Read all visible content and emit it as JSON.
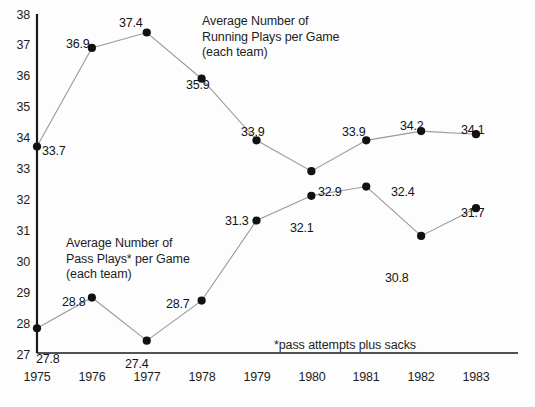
{
  "chart_data": {
    "type": "line",
    "title": "",
    "xlabel": "",
    "ylabel": "",
    "categories": [
      "1975",
      "1976",
      "1977",
      "1978",
      "1979",
      "1980",
      "1981",
      "1982",
      "1983"
    ],
    "x": [
      1975,
      1976,
      1977,
      1978,
      1979,
      1980,
      1981,
      1982,
      1983
    ],
    "ylim": [
      27,
      38
    ],
    "xlim": [
      1975,
      1983
    ],
    "grid": false,
    "legend_position": "inline-annotation",
    "yticks": [
      "27",
      "28",
      "29",
      "30",
      "31",
      "32",
      "33",
      "34",
      "35",
      "36",
      "37",
      "38"
    ],
    "series": [
      {
        "name": "Average Number of Running Plays per Game (each team)",
        "values": [
          33.7,
          36.9,
          37.4,
          35.9,
          33.9,
          32.9,
          33.9,
          34.2,
          34.1
        ],
        "labels": [
          "33.7",
          "36.9",
          "37.4",
          "35.9",
          "33.9",
          "32.9",
          "33.9",
          "34.2",
          "34.1"
        ]
      },
      {
        "name": "Average Number of Pass Plays* per Game (each team)",
        "values": [
          27.8,
          28.8,
          27.4,
          28.7,
          31.3,
          32.1,
          32.4,
          30.8,
          31.7
        ],
        "labels": [
          "27.8",
          "28.8",
          "27.4",
          "28.7",
          "31.3",
          "32.1",
          "32.4",
          "30.8",
          "31.7"
        ]
      }
    ],
    "annotations": [
      {
        "id": "running-annotation",
        "lines": [
          "Average Number of",
          "Running Plays per Game",
          "(each team)"
        ]
      },
      {
        "id": "pass-annotation",
        "lines": [
          "Average Number of",
          "Pass Plays* per Game",
          "(each team)"
        ]
      }
    ],
    "footnote": "*pass attempts plus sacks",
    "colors": {
      "line": "#9a9a9a",
      "marker": "#111111",
      "axis": "#1a1a1a",
      "text": "#1d1d1d",
      "background": "#fdfdfd"
    }
  },
  "point_labels": {
    "running": [
      {
        "text": "33.7",
        "x": 42,
        "y": 144
      },
      {
        "text": "36.9",
        "x": 66,
        "y": 37
      },
      {
        "text": "37.4",
        "x": 119,
        "y": 16
      },
      {
        "text": "35.9",
        "x": 186,
        "y": 78
      },
      {
        "text": "33.9",
        "x": 241,
        "y": 125
      },
      {
        "text": "32.9",
        "x": 318,
        "y": 185
      },
      {
        "text": "33.9",
        "x": 342,
        "y": 125
      },
      {
        "text": "34.2",
        "x": 400,
        "y": 119
      },
      {
        "text": "34.1",
        "x": 461,
        "y": 123
      }
    ],
    "pass": [
      {
        "text": "27.8",
        "x": 36,
        "y": 352
      },
      {
        "text": "28.8",
        "x": 62,
        "y": 295
      },
      {
        "text": "27.4",
        "x": 125,
        "y": 357
      },
      {
        "text": "28.7",
        "x": 166,
        "y": 297
      },
      {
        "text": "31.3",
        "x": 225,
        "y": 214
      },
      {
        "text": "32.1",
        "x": 290,
        "y": 221
      },
      {
        "text": "32.4",
        "x": 391,
        "y": 185
      },
      {
        "text": "30.8",
        "x": 385,
        "y": 271
      },
      {
        "text": "31.7",
        "x": 461,
        "y": 206
      }
    ]
  },
  "y_axis_labels": [
    {
      "text": "38",
      "y": 8
    },
    {
      "text": "37",
      "y": 38
    },
    {
      "text": "36",
      "y": 69
    },
    {
      "text": "35",
      "y": 100
    },
    {
      "text": "34",
      "y": 131
    },
    {
      "text": "33",
      "y": 162
    },
    {
      "text": "32",
      "y": 193
    },
    {
      "text": "31",
      "y": 224
    },
    {
      "text": "30",
      "y": 255
    },
    {
      "text": "29",
      "y": 286
    },
    {
      "text": "28",
      "y": 317
    },
    {
      "text": "27",
      "y": 348
    }
  ],
  "x_axis_labels": [
    {
      "text": "1975",
      "x": 37
    },
    {
      "text": "1976",
      "x": 92
    },
    {
      "text": "1977",
      "x": 147
    },
    {
      "text": "1978",
      "x": 202
    },
    {
      "text": "1979",
      "x": 257
    },
    {
      "text": "1980",
      "x": 312
    },
    {
      "text": "1981",
      "x": 366
    },
    {
      "text": "1982",
      "x": 421
    },
    {
      "text": "1983",
      "x": 476
    }
  ],
  "annotation_blocks": {
    "running": {
      "line1": "Average Number of",
      "line2": "Running Plays per Game",
      "line3": "(each team)",
      "x": 202,
      "y": 14
    },
    "pass": {
      "line1": "Average Number of",
      "line2": "Pass Plays* per Game",
      "line3": "(each team)",
      "x": 66,
      "y": 236
    }
  },
  "footnote": {
    "text": "*pass attempts plus sacks",
    "x": 274,
    "y": 338
  }
}
